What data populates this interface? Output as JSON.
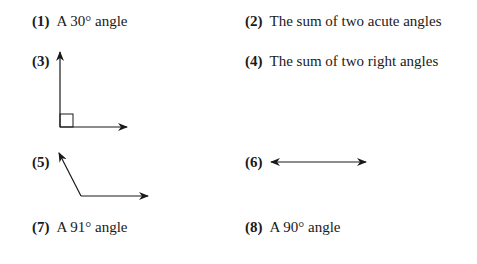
{
  "items": [
    {
      "number": "(1)",
      "text": "A 30° angle"
    },
    {
      "number": "(2)",
      "text": "The sum of two acute angles"
    },
    {
      "number": "(3)",
      "text": "",
      "figure": "right-angle-with-rays"
    },
    {
      "number": "(4)",
      "text": "The sum of two right angles"
    },
    {
      "number": "(5)",
      "text": "",
      "figure": "obtuse-angle-with-rays"
    },
    {
      "number": "(6)",
      "text": "",
      "figure": "straight-line-double-arrow"
    },
    {
      "number": "(7)",
      "text": "A 91° angle"
    },
    {
      "number": "(8)",
      "text": "A 90° angle"
    }
  ],
  "colors": {
    "ink": "#1a1a1a",
    "background": "#ffffff"
  }
}
